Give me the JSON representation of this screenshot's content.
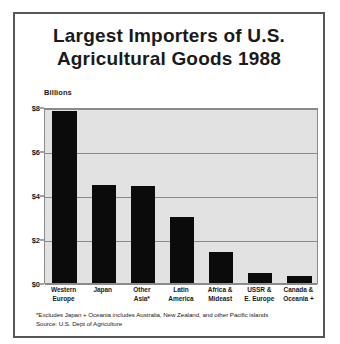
{
  "chart_data": {
    "type": "bar",
    "title": "Largest Importers of U.S. Agricultural Goods 1988",
    "title_lines": [
      "Largest Importers of U.S.",
      "Agricultural Goods 1988"
    ],
    "xlabel": "",
    "ylabel": "Billions",
    "ylim": [
      0,
      8
    ],
    "grid": true,
    "legend": "none",
    "bar_color": "#0b0b0b",
    "plot_background": "#e2e2e2",
    "ytick_labels": [
      "$8",
      "$6",
      "$4",
      "$2",
      "$0"
    ],
    "ytick_values": [
      8,
      6,
      4,
      2,
      0
    ],
    "categories": [
      "Western Europe",
      "Japan",
      "Other Asia*",
      "Latin America",
      "Africa & Mideast",
      "USSR & E. Europe",
      "Canada & Oceania +"
    ],
    "category_lines": [
      [
        "Western",
        "Europe"
      ],
      [
        "Japan",
        ""
      ],
      [
        "Other",
        "Asia*"
      ],
      [
        "Latin",
        "America"
      ],
      [
        "Africa &",
        "Mideast"
      ],
      [
        "USSR &",
        "E. Europe"
      ],
      [
        "Canada &",
        "Oceania +"
      ]
    ],
    "values": [
      7.8,
      4.45,
      4.4,
      3.0,
      1.4,
      0.45,
      0.3
    ],
    "annotations": [
      "*Excludes Japan  + Oceania includes Australia, New Zealand, and other Pacific islands",
      "Source: U.S. Dept of Agriculture"
    ]
  },
  "footnotes": {
    "line1": "*Excludes Japan  + Oceania includes Australia, New Zealand, and other Pacific islands",
    "line2": "Source: U.S. Dept of Agriculture"
  }
}
